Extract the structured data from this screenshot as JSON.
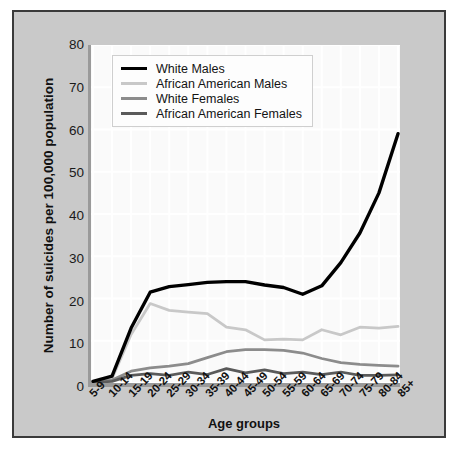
{
  "figure": {
    "background": "#c9c9c9",
    "plot_background": "#fafafa",
    "border_color": "#3a3a3a"
  },
  "chart_data": {
    "type": "line",
    "title": "",
    "xlabel": "Age groups",
    "ylabel": "Number of suicides per 100,000 population",
    "categories": [
      "5-9",
      "10-14",
      "15-19",
      "20-24",
      "25-29",
      "30-34",
      "35-39",
      "40-44",
      "45-49",
      "50-54",
      "55-59",
      "60-64",
      "65-69",
      "70-74",
      "75-79",
      "80-84",
      "85+"
    ],
    "ylim": [
      0,
      80
    ],
    "yticks": [
      0,
      10,
      20,
      30,
      40,
      50,
      60,
      70,
      80
    ],
    "grid": true,
    "legend_position": "upper left",
    "series": [
      {
        "name": "White Males",
        "color": "#000000",
        "values": [
          0.4,
          1.6,
          13.0,
          21.5,
          22.8,
          23.3,
          23.8,
          24.0,
          24.0,
          23.2,
          22.6,
          21.0,
          23.0,
          28.5,
          35.5,
          45.0,
          59.0
        ]
      },
      {
        "name": "African American Males",
        "color": "#c8c8c8",
        "values": [
          0.2,
          1.0,
          11.5,
          18.8,
          17.2,
          16.8,
          16.4,
          13.2,
          12.6,
          10.2,
          10.4,
          10.2,
          12.6,
          11.4,
          13.2,
          13.0,
          13.4
        ]
      },
      {
        "name": "White Females",
        "color": "#8c8c8c",
        "values": [
          0.2,
          0.7,
          2.8,
          3.6,
          4.0,
          4.6,
          6.0,
          7.4,
          7.9,
          7.9,
          7.7,
          7.1,
          5.8,
          4.8,
          4.4,
          4.2,
          4.0
        ]
      },
      {
        "name": "African American Females",
        "color": "#5a5a5a",
        "values": [
          0.1,
          0.4,
          1.8,
          2.2,
          1.8,
          2.6,
          2.0,
          3.4,
          2.4,
          3.1,
          2.2,
          2.6,
          2.0,
          2.6,
          1.8,
          1.8,
          1.9
        ]
      }
    ]
  }
}
